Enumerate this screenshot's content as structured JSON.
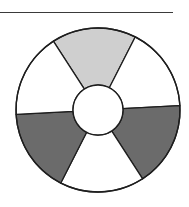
{
  "diagram": {
    "type": "segmented-ring",
    "center": [
      98,
      110
    ],
    "outer_radius": 82,
    "inner_radius": 25,
    "rotation_deg": -3,
    "stroke_color": "#1e1e1e",
    "segments": [
      {
        "name": "segment-top",
        "start_deg": 237,
        "end_deg": 297,
        "fill": "#cfcfcf",
        "shade": "light-gray"
      },
      {
        "name": "segment-upper-right",
        "start_deg": 297,
        "end_deg": 357,
        "fill": "#ffffff",
        "shade": "white"
      },
      {
        "name": "segment-lower-right",
        "start_deg": -3,
        "end_deg": 57,
        "fill": "#6b6b6b",
        "shade": "dark-gray"
      },
      {
        "name": "segment-bottom",
        "start_deg": 57,
        "end_deg": 117,
        "fill": "#ffffff",
        "shade": "white"
      },
      {
        "name": "segment-lower-left",
        "start_deg": 117,
        "end_deg": 177,
        "fill": "#6b6b6b",
        "shade": "dark-gray"
      },
      {
        "name": "segment-upper-left",
        "start_deg": 177,
        "end_deg": 237,
        "fill": "#ffffff",
        "shade": "white"
      }
    ]
  }
}
